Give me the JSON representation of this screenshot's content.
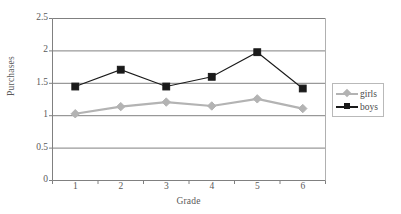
{
  "chart_data": {
    "type": "line",
    "title": "",
    "xlabel": "Grade",
    "ylabel": "Purchases",
    "categories": [
      "1",
      "2",
      "3",
      "4",
      "5",
      "6"
    ],
    "ylim": [
      0,
      2.5
    ],
    "yticks": [
      "0",
      "0.5",
      "1",
      "1.5",
      "2",
      "2.5"
    ],
    "ytick_values": [
      0,
      0.5,
      1,
      1.5,
      2,
      2.5
    ],
    "grid": "horizontal",
    "legend_position": "right",
    "series": [
      {
        "name": "girls",
        "color": "#b3b3b3",
        "marker": "diamond",
        "values": [
          1.03,
          1.14,
          1.21,
          1.15,
          1.26,
          1.11
        ]
      },
      {
        "name": "boys",
        "color": "#1a1a1a",
        "marker": "square",
        "values": [
          1.45,
          1.71,
          1.45,
          1.6,
          1.98,
          1.42
        ]
      }
    ]
  },
  "legend": {
    "items": [
      {
        "label": "girls"
      },
      {
        "label": "boys"
      }
    ]
  },
  "axes": {
    "y_title": "Purchases",
    "x_title": "Grade"
  }
}
